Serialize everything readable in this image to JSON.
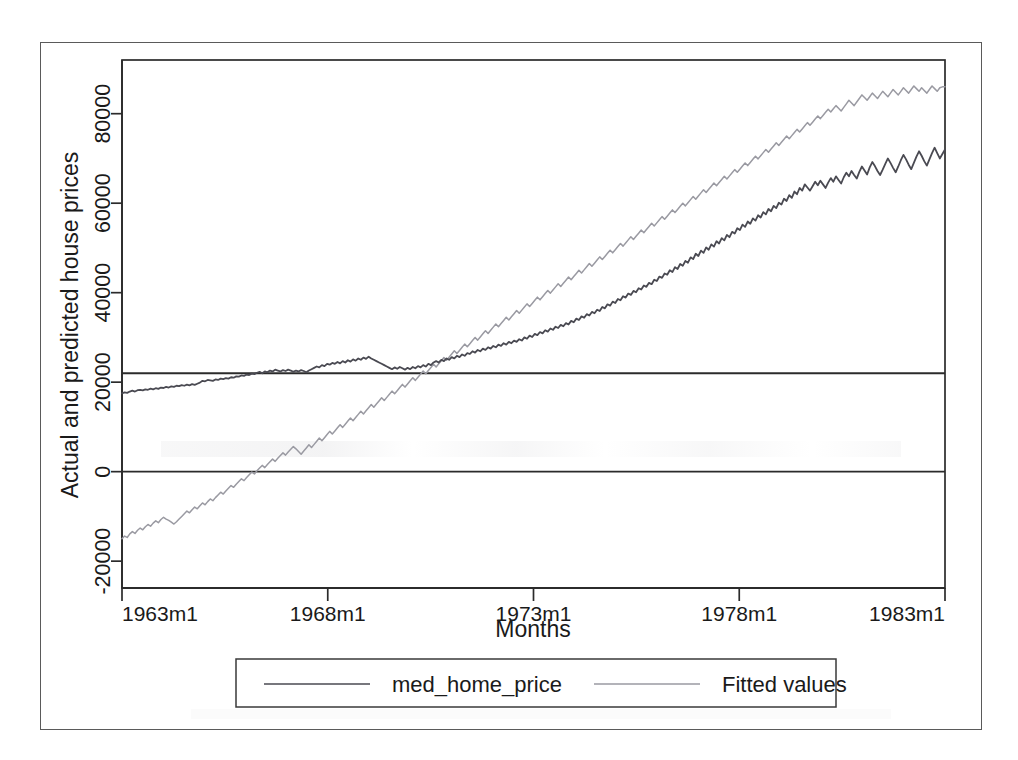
{
  "chart_data": {
    "type": "line",
    "title": "",
    "xlabel": "Months",
    "ylabel": "Actual and predicted house prices",
    "xlim": [
      1963,
      1983
    ],
    "ylim": [
      -26000,
      92000
    ],
    "grid": false,
    "x_tick_labels": [
      "1963m1",
      "1968m1",
      "1973m1",
      "1978m1",
      "1983m1"
    ],
    "x_tick_values": [
      1963,
      1968,
      1973,
      1978,
      1983
    ],
    "y_tick_labels": [
      "80000",
      "60000",
      "40000",
      "20000",
      "0",
      "-20000"
    ],
    "y_tick_values": [
      80000,
      60000,
      40000,
      20000,
      0,
      -20000
    ],
    "reference_lines": [
      22000,
      0
    ],
    "legend_position": "bottom-outside",
    "series": [
      {
        "name": "med_home_price",
        "color": "#4a4a52",
        "start_value": 17500,
        "end_value": 72000,
        "values": [
          17500,
          17700,
          17600,
          17900,
          18100,
          17900,
          18200,
          18300,
          18150,
          18400,
          18300,
          18550,
          18400,
          18650,
          18500,
          18800,
          18700,
          18950,
          18800,
          19050,
          18950,
          19200,
          19100,
          19350,
          19200,
          19450,
          19300,
          19550,
          19400,
          19650,
          19900,
          20300,
          20200,
          20500,
          20400,
          20300,
          20600,
          20500,
          20800,
          20700,
          20900,
          20800,
          21100,
          21000,
          21300,
          21250,
          21500,
          21400,
          21700,
          21600,
          21900,
          21800,
          22100,
          22300,
          22000,
          22400,
          22200,
          22600,
          22400,
          22800,
          22600,
          22400,
          22700,
          22500,
          22800,
          22600,
          22300,
          22600,
          22400,
          22700,
          22500,
          22200,
          22600,
          22900,
          23200,
          23500,
          23300,
          23800,
          23600,
          24100,
          23900,
          24300,
          24100,
          24500,
          24200,
          24700,
          24400,
          24900,
          24600,
          25100,
          24800,
          25300,
          25000,
          25500,
          25200,
          25700,
          25300,
          25000,
          24700,
          24400,
          24100,
          23800,
          23500,
          23200,
          22900,
          23300,
          23000,
          23400,
          23100,
          22800,
          23200,
          22900,
          23400,
          23100,
          23600,
          23300,
          23800,
          23500,
          24100,
          23800,
          24400,
          24700,
          24400,
          25000,
          24700,
          25300,
          25000,
          25600,
          25300,
          25900,
          25600,
          26200,
          25900,
          26500,
          26300,
          26900,
          26600,
          27200,
          26900,
          27500,
          27200,
          27800,
          27500,
          28100,
          27800,
          28400,
          28100,
          28700,
          28400,
          29000,
          28700,
          29300,
          29000,
          29600,
          29300,
          30000,
          29700,
          30400,
          30100,
          30800,
          30500,
          31200,
          30900,
          31600,
          31300,
          32000,
          31700,
          32400,
          32100,
          32800,
          32500,
          33200,
          32900,
          33700,
          33400,
          34200,
          33900,
          34700,
          34400,
          35200,
          34900,
          35700,
          35400,
          36200,
          35900,
          36800,
          36500,
          37400,
          37100,
          38000,
          37700,
          38600,
          38300,
          39200,
          38900,
          39800,
          39500,
          40400,
          40100,
          41000,
          40700,
          41600,
          41300,
          42200,
          41900,
          42900,
          42600,
          43600,
          43300,
          44300,
          44000,
          45000,
          44600,
          45700,
          45300,
          46400,
          46000,
          47100,
          46700,
          47900,
          47500,
          48700,
          48200,
          49400,
          48900,
          50100,
          49600,
          50800,
          50300,
          51500,
          51000,
          52200,
          51700,
          52900,
          52400,
          53600,
          53200,
          54400,
          54000,
          55200,
          54700,
          55900,
          55400,
          56600,
          56100,
          57300,
          56800,
          58000,
          57500,
          58700,
          58200,
          59400,
          58900,
          60100,
          59700,
          61000,
          60500,
          61800,
          61200,
          62600,
          62000,
          63400,
          62800,
          64200,
          63500,
          62800,
          63800,
          64800,
          64000,
          65000,
          64200,
          63400,
          64600,
          65600,
          64800,
          66000,
          65200,
          64400,
          65800,
          66800,
          66000,
          67200,
          66300,
          65500,
          67000,
          68200,
          67300,
          66400,
          68000,
          69200,
          68300,
          67200,
          66300,
          67500,
          68800,
          70000,
          69000,
          67900,
          66900,
          68200,
          69600,
          70800,
          69800,
          68600,
          67600,
          69000,
          70400,
          71600,
          70600,
          69400,
          68400,
          69800,
          71200,
          72400,
          71200,
          70000,
          71000,
          72000
        ]
      },
      {
        "name": "Fitted values",
        "color": "#9a9aa2",
        "start_value": -15000,
        "end_value": 86000,
        "values": [
          -15000,
          -14400,
          -14700,
          -13900,
          -13400,
          -13800,
          -13100,
          -12600,
          -13000,
          -12300,
          -11800,
          -12200,
          -11500,
          -11000,
          -11400,
          -10700,
          -10200,
          -10600,
          -10900,
          -11300,
          -11700,
          -11200,
          -10600,
          -10000,
          -9400,
          -8800,
          -9200,
          -8500,
          -7900,
          -8300,
          -7600,
          -7000,
          -7400,
          -6700,
          -6100,
          -6500,
          -5800,
          -5200,
          -4600,
          -5000,
          -4300,
          -3700,
          -3100,
          -3500,
          -2800,
          -2200,
          -1600,
          -2000,
          -1300,
          -700,
          -100,
          -500,
          200,
          800,
          1400,
          900,
          1600,
          2200,
          2800,
          2300,
          3000,
          3600,
          4200,
          3700,
          4400,
          5000,
          5600,
          5100,
          4500,
          3900,
          4600,
          5300,
          6000,
          5400,
          6100,
          6800,
          7500,
          6900,
          7600,
          8300,
          9000,
          8400,
          9100,
          9800,
          10500,
          9900,
          10600,
          11300,
          12000,
          11400,
          12100,
          12800,
          13500,
          12900,
          13600,
          14300,
          15000,
          14400,
          15100,
          15800,
          16500,
          15900,
          16600,
          17300,
          18000,
          17400,
          18100,
          18800,
          19500,
          18900,
          19600,
          20300,
          21000,
          20400,
          21100,
          21800,
          22500,
          21900,
          22600,
          23300,
          24000,
          23400,
          24100,
          24800,
          25500,
          24900,
          25600,
          26300,
          27000,
          26400,
          27100,
          27800,
          28500,
          27900,
          28600,
          29300,
          30000,
          29400,
          30100,
          30800,
          31500,
          30900,
          31600,
          32300,
          33000,
          32400,
          33100,
          33800,
          34500,
          33900,
          34600,
          35300,
          36000,
          35400,
          36100,
          36800,
          37500,
          36900,
          37600,
          38300,
          39000,
          38400,
          39100,
          39800,
          40500,
          39900,
          40600,
          41300,
          42000,
          41400,
          42100,
          42800,
          43500,
          42900,
          43600,
          44300,
          45000,
          44400,
          45100,
          45800,
          46500,
          45900,
          46600,
          47300,
          48000,
          47400,
          48100,
          48800,
          49500,
          48900,
          49600,
          50300,
          51000,
          50400,
          51100,
          51800,
          52500,
          51900,
          52600,
          53300,
          54000,
          53400,
          54100,
          54800,
          55500,
          54900,
          55600,
          56300,
          57000,
          56400,
          57100,
          57800,
          58500,
          57900,
          58600,
          59300,
          60000,
          59400,
          60100,
          60800,
          61500,
          60900,
          61600,
          62300,
          63000,
          62400,
          63100,
          63800,
          64500,
          63900,
          64600,
          65300,
          66000,
          65400,
          66100,
          66800,
          67500,
          66900,
          67600,
          68300,
          69000,
          68400,
          69100,
          69800,
          70500,
          69900,
          70600,
          71300,
          72000,
          71400,
          72100,
          72800,
          73500,
          72900,
          73600,
          74300,
          75000,
          74400,
          75100,
          75800,
          76500,
          75900,
          76600,
          77300,
          78000,
          77400,
          78100,
          78800,
          79500,
          78900,
          79600,
          80300,
          81000,
          80400,
          81100,
          81800,
          81200,
          80600,
          81400,
          82200,
          83000,
          82400,
          81800,
          82600,
          83400,
          84200,
          83600,
          83000,
          83800,
          84600,
          84000,
          83400,
          84200,
          85000,
          84400,
          83800,
          84600,
          85400,
          84800,
          84200,
          85000,
          85800,
          85200,
          84600,
          85400,
          86200,
          85600,
          85000,
          85800,
          85200,
          84600,
          85400,
          86200,
          85600,
          85000,
          85800,
          86000,
          86000
        ]
      }
    ]
  },
  "legend": {
    "entries": [
      {
        "label": "med_home_price",
        "color": "#4a4a52"
      },
      {
        "label": "Fitted values",
        "color": "#9a9aa2"
      }
    ]
  },
  "axes": {
    "y_title": "Actual and predicted house prices",
    "x_title": "Months",
    "y_ticks": [
      "80000",
      "60000",
      "40000",
      "20000",
      "0",
      "-20000"
    ],
    "x_ticks": [
      "1963m1",
      "1968m1",
      "1973m1",
      "1978m1",
      "1983m1"
    ]
  },
  "colors": {
    "frame": "#5a5a5a",
    "axis": "#2b2b2b",
    "series_actual": "#4a4a52",
    "series_fitted": "#9a9aa2",
    "text": "#1a1a1a",
    "background": "#ffffff"
  }
}
